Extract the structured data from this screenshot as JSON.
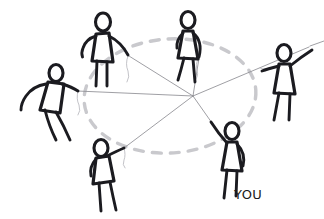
{
  "canvas": {
    "width": 324,
    "height": 219,
    "background": "#ffffff",
    "title": "network-of-people-sketch"
  },
  "style": {
    "ink_color": "#1b1b20",
    "thread_color": "#8e8e93",
    "ring_color": "#c9c9cd",
    "label_color": "#1b1b20"
  },
  "hub": {
    "name": "connection-hub",
    "x": 193,
    "y": 96
  },
  "ring": {
    "name": "dashed-ellipse",
    "cx": 170,
    "cy": 96,
    "rx": 86,
    "ry": 57,
    "rotation": -4,
    "dash": "9 9"
  },
  "figures": [
    {
      "id": "figure-top-left",
      "label": "",
      "pose": "leaning-right-arm-extended",
      "head_x": 103,
      "head_y": 22,
      "hand_x": 128,
      "hand_y": 55
    },
    {
      "id": "figure-top-center",
      "label": "",
      "pose": "standing-arm-down",
      "head_x": 188,
      "head_y": 20,
      "hand_x": 198,
      "hand_y": 57
    },
    {
      "id": "figure-right",
      "label": "",
      "pose": "arm-raised-off-frame",
      "head_x": 284,
      "head_y": 53,
      "hand_x": 310,
      "hand_y": 46
    },
    {
      "id": "figure-left",
      "label": "",
      "pose": "leaning-arm-extended-right",
      "head_x": 56,
      "head_y": 73,
      "hand_x": 78,
      "hand_y": 91
    },
    {
      "id": "figure-bottom-left",
      "label": "",
      "pose": "bending-arm-up-right",
      "head_x": 101,
      "head_y": 148,
      "hand_x": 124,
      "hand_y": 148
    },
    {
      "id": "figure-bottom-right",
      "label": "YOU",
      "pose": "arm-raised-up-left",
      "head_x": 232,
      "head_y": 131,
      "hand_x": 211,
      "hand_y": 122
    }
  ],
  "connections": [
    {
      "name": "thread-to-top-left",
      "from": "hub",
      "to": "figure-top-left"
    },
    {
      "name": "thread-to-top-center",
      "from": "hub",
      "to": "figure-top-center"
    },
    {
      "name": "thread-to-right",
      "from": "hub",
      "to": "figure-right"
    },
    {
      "name": "thread-to-left",
      "from": "hub",
      "to": "figure-left"
    },
    {
      "name": "thread-to-bottom-left",
      "from": "hub",
      "to": "figure-bottom-left"
    },
    {
      "name": "thread-to-bottom-right",
      "from": "hub",
      "to": "figure-bottom-right"
    }
  ],
  "labels": {
    "you": "YOU"
  }
}
